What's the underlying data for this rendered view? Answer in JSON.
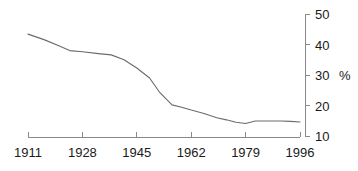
{
  "chart_data": {
    "type": "line",
    "title": "",
    "subtitle": "",
    "xlabel": "",
    "ylabel": "%",
    "unit_label": "%",
    "grid": false,
    "legend": null,
    "xlim": [
      1911,
      1996
    ],
    "ylim": [
      10,
      50
    ],
    "x_ticks": [
      1911,
      1928,
      1945,
      1962,
      1979,
      1996
    ],
    "x_tick_labels": [
      "1911",
      "1928",
      "1945",
      "1962",
      "1979",
      "1996"
    ],
    "y_ticks": [
      10,
      20,
      30,
      40,
      50
    ],
    "y_tick_labels": [
      "10",
      "20",
      "30",
      "40",
      "50"
    ],
    "series": [
      {
        "name": "value",
        "color": "#6b6b6b",
        "x": [
          1911,
          1916,
          1921,
          1924,
          1928,
          1933,
          1937,
          1941,
          1945,
          1949,
          1952,
          1956,
          1959,
          1962,
          1966,
          1970,
          1973,
          1976,
          1979,
          1982,
          1986,
          1990,
          1993,
          1996
        ],
        "values": [
          43.4,
          41.6,
          39.4,
          38.0,
          37.6,
          37.0,
          36.6,
          35.0,
          32.3,
          29.0,
          24.5,
          20.2,
          19.4,
          18.5,
          17.4,
          16.0,
          15.3,
          14.5,
          14.1,
          14.9,
          14.9,
          14.9,
          14.8,
          14.6
        ]
      }
    ]
  },
  "axes_geometry": {
    "x_pixel_range": [
      28,
      300
    ],
    "y_pixel_range": [
      136,
      14
    ]
  },
  "colors": {
    "line": "#6b6b6b",
    "axis": "#8a8a8a",
    "text": "#1a1a1a",
    "background": "#ffffff"
  }
}
